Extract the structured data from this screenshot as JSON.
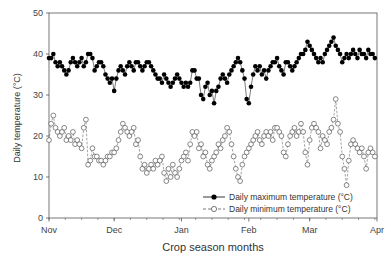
{
  "chart_data": {
    "type": "line",
    "title": "",
    "xlabel": "Crop season months",
    "ylabel": "Daily temperature (°C)",
    "ylim": [
      0,
      50
    ],
    "yticks": [
      0,
      10,
      20,
      30,
      40,
      50
    ],
    "xticks": [
      "Nov",
      "Dec",
      "Jan",
      "Feb",
      "Mar",
      "Apr"
    ],
    "x_range_days": [
      0,
      151
    ],
    "xtick_days": [
      0,
      30,
      61,
      92,
      120,
      151
    ],
    "grid": false,
    "legend_position": "lower right inside",
    "series": [
      {
        "name": "Daily maximum temperature (°C)",
        "marker": "filled-circle",
        "line": "solid",
        "color": "#000000",
        "values": [
          39,
          39,
          40,
          38,
          37,
          38,
          37,
          36,
          35,
          36,
          38,
          39,
          38,
          37,
          38,
          39,
          37,
          38,
          40,
          40,
          39,
          36,
          37,
          38,
          38,
          37,
          35,
          34,
          33,
          34,
          31,
          34,
          36,
          37,
          36,
          35,
          37,
          38,
          37,
          36,
          38,
          38,
          37,
          36,
          37,
          38,
          38,
          37,
          36,
          35,
          34,
          34,
          33,
          35,
          34,
          33,
          32,
          33,
          34,
          35,
          34,
          33,
          32,
          33,
          32,
          33,
          36,
          36,
          34,
          34,
          30,
          29,
          32,
          33,
          30,
          31,
          28,
          31,
          32,
          34,
          35,
          34,
          33,
          35,
          36,
          37,
          38,
          39,
          38,
          36,
          34,
          29,
          28,
          32,
          35,
          37,
          36,
          37,
          35,
          36,
          34,
          36,
          37,
          38,
          38,
          39,
          37,
          36,
          35,
          38,
          38,
          37,
          36,
          37,
          38,
          39,
          40,
          40,
          41,
          43,
          42,
          41,
          40,
          39,
          38,
          39,
          38,
          40,
          41,
          42,
          43,
          44,
          42,
          41,
          40,
          38,
          39,
          40,
          39,
          40,
          41,
          40,
          39,
          41,
          40,
          40,
          39,
          41,
          40,
          40,
          39
        ]
      },
      {
        "name": "Daily minimum temperature (°C)",
        "marker": "open-circle",
        "line": "dashed",
        "color": "#000000",
        "values": [
          19,
          23,
          25,
          22,
          21,
          20,
          21,
          22,
          19,
          20,
          19,
          21,
          18,
          19,
          18,
          17,
          22,
          24,
          13,
          14,
          17,
          15,
          15,
          14,
          14,
          13,
          14,
          15,
          15,
          16,
          16,
          17,
          19,
          21,
          23,
          22,
          21,
          20,
          21,
          22,
          18,
          19,
          15,
          12,
          13,
          11,
          12,
          13,
          12,
          14,
          13,
          14,
          15,
          11,
          9,
          12,
          10,
          13,
          11,
          10,
          12,
          14,
          15,
          16,
          14,
          18,
          21,
          20,
          21,
          17,
          18,
          15,
          16,
          13,
          12,
          14,
          15,
          16,
          18,
          17,
          19,
          20,
          22,
          21,
          18,
          15,
          12,
          10,
          9,
          13,
          15,
          16,
          17,
          18,
          19,
          20,
          21,
          19,
          18,
          20,
          21,
          20,
          21,
          19,
          22,
          22,
          21,
          20,
          16,
          15,
          18,
          20,
          21,
          22,
          20,
          21,
          23,
          21,
          16,
          13,
          19,
          22,
          23,
          22,
          21,
          17,
          20,
          19,
          18,
          21,
          22,
          24,
          29,
          23,
          21,
          15,
          12,
          8,
          14,
          18,
          19,
          18,
          17,
          16,
          17,
          15,
          12,
          16,
          17,
          16,
          15
        ]
      }
    ]
  },
  "legend": {
    "max_label": "Daily maximum temperature (°C)",
    "min_label": "Daily minimum temperature (°C)"
  },
  "axes": {
    "x_title": "Crop season months",
    "y_title": "Daily temperature (°C)"
  }
}
